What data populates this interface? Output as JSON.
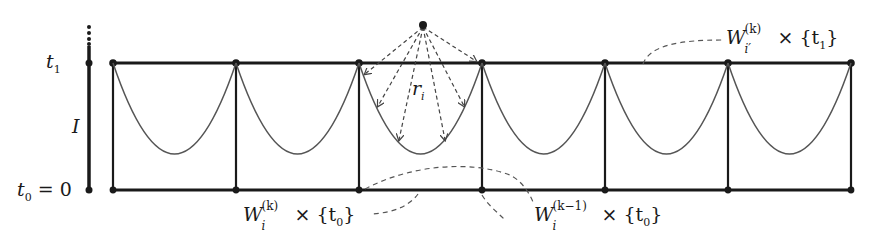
{
  "diagram": {
    "type": "graph-diagram",
    "colors": {
      "stroke": "#1a1a1a",
      "curve": "#555555",
      "dashed": "#555555",
      "background": "#ffffff"
    },
    "axis": {
      "label_t1": "t",
      "label_t1_sub": "1",
      "label_I": "I",
      "label_t0": "t",
      "label_t0_sub": "0",
      "label_t0_eq": " = 0"
    },
    "grid": {
      "columns_x": [
        113,
        236,
        359,
        482,
        605,
        728,
        851
      ],
      "top_y": 63,
      "bottom_y": 190,
      "curve_min_y": 154
    },
    "apex": {
      "x": 423,
      "y": 25,
      "label": "r",
      "label_sub": "i",
      "arrow_count": 6
    },
    "labels": {
      "top_right": {
        "W": "W",
        "sup": "(k)",
        "sub": "i′",
        "times": "×",
        "set": "{t",
        "set_sub": "1",
        "set_close": "}"
      },
      "bottom_left": {
        "W": "W",
        "sup": "(k)",
        "sub": "i",
        "times": "×",
        "set": "{t",
        "set_sub": "0",
        "set_close": "}"
      },
      "bottom_right": {
        "W": "W",
        "sup": "(k−1)",
        "sub": "i",
        "times": "×",
        "set": "{t",
        "set_sub": "0",
        "set_close": "}"
      }
    }
  }
}
